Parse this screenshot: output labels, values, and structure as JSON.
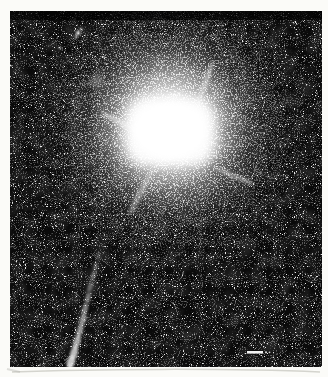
{
  "figure": {
    "type": "scanned-photograph",
    "alt": "Quasar with optical jet"
  },
  "colors": {
    "page_background": "#fbfbf8",
    "photo_background": "#0a0a0a",
    "core": "#ffffff",
    "halo": "#e8e8e8",
    "spike": "#e0e0e0",
    "jet": "#dcdcdc",
    "fuzzy_object": "#909090",
    "scale_bar": "#f2f2f2",
    "scale_bar_dots": "#cfcfcf",
    "shadow_line": "#b5b5ac"
  },
  "scale_bar": {
    "present": "true",
    "label": ""
  }
}
